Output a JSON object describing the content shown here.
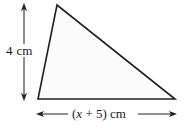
{
  "figure": {
    "background_color": "#ffffff",
    "stroke_color": "#231f20",
    "fill_color": "#fbfbfb",
    "width": 189,
    "height": 129
  },
  "shape": {
    "type": "triangle",
    "name": "triangle",
    "vertices": [
      {
        "name": "apex",
        "x": 57,
        "y": 5
      },
      {
        "name": "bottom-left",
        "x": 38,
        "y": 99
      },
      {
        "name": "bottom-right",
        "x": 175,
        "y": 99
      }
    ],
    "points_attr": "57,5 38,99 175,99"
  },
  "height_dimension": {
    "name": "height-dimension",
    "value": "4",
    "unit": "cm",
    "label": "4 cm",
    "orientation": "vertical",
    "x": 24,
    "y_start": 5,
    "y_end": 99,
    "arrowheads": "both"
  },
  "base_dimension": {
    "name": "base-dimension",
    "expression_open": "(",
    "variable": "x",
    "operator": "+",
    "constant": "5",
    "expression_close": ")",
    "unit": "cm",
    "label": "(x + 5) cm",
    "orientation": "horizontal",
    "y": 114,
    "x_start": 38,
    "x_end": 175,
    "arrowheads": "both"
  }
}
